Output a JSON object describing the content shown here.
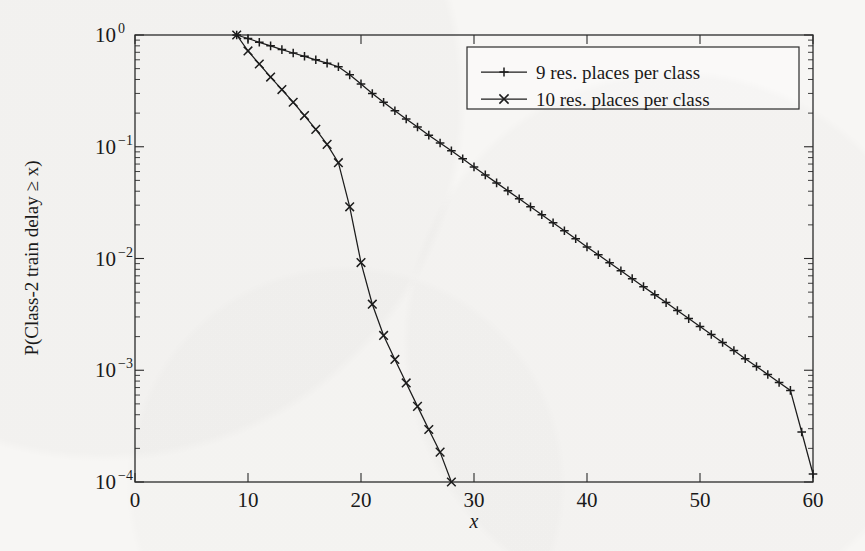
{
  "chart_data": {
    "type": "line",
    "title": "",
    "xlabel": "x",
    "ylabel": "P(Class-2 train delay ≥ x)",
    "xlim": [
      0,
      60
    ],
    "ylim": [
      0.0001,
      1
    ],
    "yscale": "log",
    "xscale": "linear",
    "grid": false,
    "legend_position": "top-right",
    "xticks": [
      0,
      10,
      20,
      30,
      40,
      50,
      60
    ],
    "xtick_labels": [
      "0",
      "10",
      "20",
      "30",
      "40",
      "50",
      "60"
    ],
    "yticks": [
      1,
      0.1,
      0.01,
      0.001,
      0.0001
    ],
    "ytick_labels": [
      "10^0",
      "10^-1",
      "10^-2",
      "10^-3",
      "10^-4"
    ],
    "ytick_mantissas": [
      "10",
      "10",
      "10",
      "10",
      "10"
    ],
    "ytick_exponents": [
      "0",
      "−1",
      "−2",
      "−3",
      "−4"
    ],
    "series": [
      {
        "name": "9 res. places per class",
        "marker": "plus",
        "x": [
          9,
          10,
          11,
          12,
          13,
          14,
          15,
          16,
          17,
          18,
          19,
          20,
          21,
          22,
          23,
          24,
          25,
          26,
          27,
          28,
          29,
          30,
          31,
          32,
          33,
          34,
          35,
          36,
          37,
          38,
          39,
          40,
          41,
          42,
          43,
          44,
          45,
          46,
          47,
          48,
          49,
          50,
          51,
          52,
          53,
          54,
          55,
          56,
          57,
          58,
          59,
          60
        ],
        "y": [
          1.0,
          0.93,
          0.86,
          0.8,
          0.74,
          0.69,
          0.645,
          0.6,
          0.56,
          0.52,
          0.44,
          0.365,
          0.3,
          0.25,
          0.21,
          0.177,
          0.15,
          0.127,
          0.108,
          0.092,
          0.078,
          0.066,
          0.056,
          0.0475,
          0.0403,
          0.0342,
          0.029,
          0.0246,
          0.0209,
          0.0177,
          0.015,
          0.0127,
          0.0108,
          0.00917,
          0.00778,
          0.0066,
          0.0056,
          0.00475,
          0.00403,
          0.00342,
          0.0029,
          0.00246,
          0.00209,
          0.00177,
          0.0015,
          0.00127,
          0.00108,
          0.000917,
          0.000778,
          0.00066,
          0.00028,
          0.000118
        ]
      },
      {
        "name": "10 res. places per class",
        "marker": "cross",
        "x": [
          9,
          10,
          11,
          12,
          13,
          14,
          15,
          16,
          17,
          18,
          19,
          20,
          21,
          22,
          23,
          24,
          25,
          26,
          27,
          28
        ],
        "y": [
          1.0,
          0.72,
          0.55,
          0.42,
          0.325,
          0.25,
          0.19,
          0.143,
          0.105,
          0.072,
          0.029,
          0.0092,
          0.0039,
          0.00205,
          0.00125,
          0.00077,
          0.000475,
          0.000295,
          0.000185,
          0.0001
        ]
      }
    ]
  },
  "legend": {
    "entries": [
      {
        "label": "9 res. places per class",
        "marker": "plus"
      },
      {
        "label": "10 res. places per class",
        "marker": "cross"
      }
    ]
  },
  "axes": {
    "x_title": "x",
    "y_title": "P(Class-2 train delay ≥ x)"
  },
  "colors": {
    "line": "#1c1c1c",
    "axis": "#2b2b2b",
    "background": "#f7f6f4"
  }
}
